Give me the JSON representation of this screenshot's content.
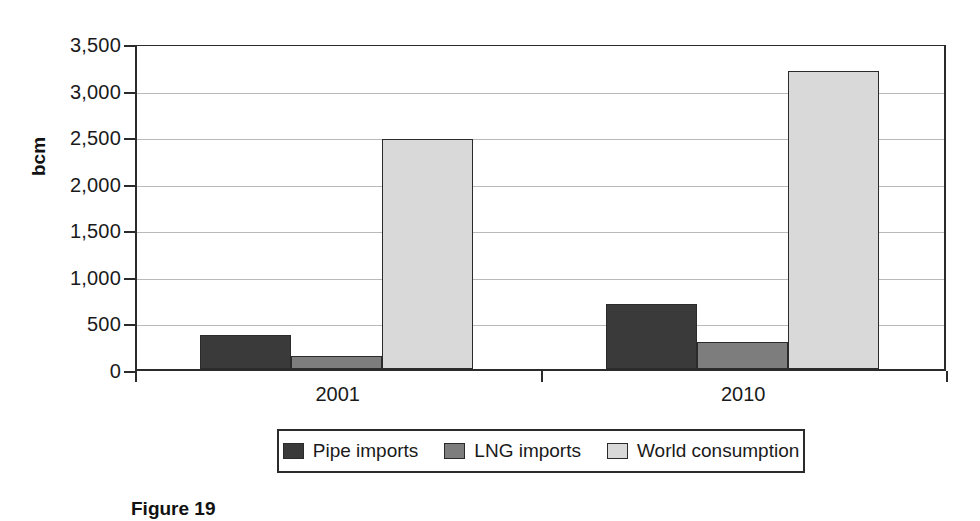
{
  "chart_data": {
    "type": "bar",
    "title": "",
    "xlabel": "",
    "ylabel": "bcm",
    "categories": [
      "2001",
      "2010"
    ],
    "series": [
      {
        "name": "Pipe imports",
        "color": "#3a3a3a",
        "values": [
          370,
          695
        ]
      },
      {
        "name": "LNG imports",
        "color": "#7d7d7d",
        "values": [
          140,
          295
        ]
      },
      {
        "name": "World consumption",
        "color": "#d9d9d9",
        "values": [
          2470,
          3200
        ]
      }
    ],
    "ylim": [
      0,
      3500
    ],
    "ytick_values": [
      0,
      500,
      1000,
      1500,
      2000,
      2500,
      3000,
      3500
    ],
    "ytick_labels": [
      "0",
      "500",
      "1,000",
      "1,500",
      "2,000",
      "2,500",
      "3,000",
      "3,500"
    ],
    "grid": true,
    "legend_position": "bottom"
  },
  "caption": {
    "text": "Figure 19"
  }
}
